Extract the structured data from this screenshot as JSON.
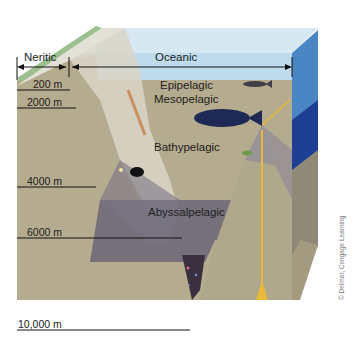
{
  "diagram": {
    "horizontal_zones": [
      {
        "label": "Neritic"
      },
      {
        "label": "Oceanic"
      }
    ],
    "vertical_zones": [
      {
        "label": "Epipelagic"
      },
      {
        "label": "Mesopelagic"
      },
      {
        "label": "Bathypelagic"
      },
      {
        "label": "Abyssalpelagic"
      }
    ],
    "depth_markers": [
      {
        "label": "200 m"
      },
      {
        "label": "2000 m"
      },
      {
        "label": "4000 m"
      },
      {
        "label": "6000 m"
      },
      {
        "label": "10,000 m"
      }
    ],
    "credit": "© Delmar, Cengage Learning"
  },
  "colors": {
    "sky": "#d7e8f3",
    "epipelagic": "#8fc3e6",
    "mesopelagic": "#5ea4d8",
    "bathypelagic": "#4a8fcf",
    "deep_blue": "#1f3f95",
    "abyssal_overlay": "#5e5a6b",
    "sediment": "#b5ab8e",
    "shelf_top": "#e3e0d6",
    "shelf_green": "#9bbf8e",
    "trench": "#3a3040",
    "vent": "#e8b93a"
  }
}
